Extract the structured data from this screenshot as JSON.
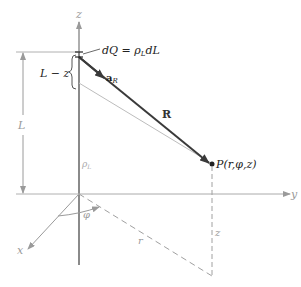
{
  "diagram": {
    "type": "line-charge-field-geometry",
    "axes": {
      "z_label": "z",
      "y_label": "y",
      "x_label": "x"
    },
    "labels": {
      "charge_element": "dQ = ρ",
      "charge_element_sub": "L",
      "charge_element_tail": "dL",
      "unit_vector": "a",
      "unit_vector_sub": "R",
      "distance_vector": "R",
      "point": "P(r,φ,z)",
      "length_L": "L",
      "length_L_minus_z": "L − z",
      "line_density": "ρ",
      "line_density_sub": "L",
      "angle": "φ",
      "radius": "r",
      "height": "z"
    },
    "colors": {
      "axis": "#9a9a9a",
      "vector": "#3a3a3a",
      "text": "#222222",
      "light": "#b0b0b0",
      "dashed": "#a0a0a0"
    }
  }
}
